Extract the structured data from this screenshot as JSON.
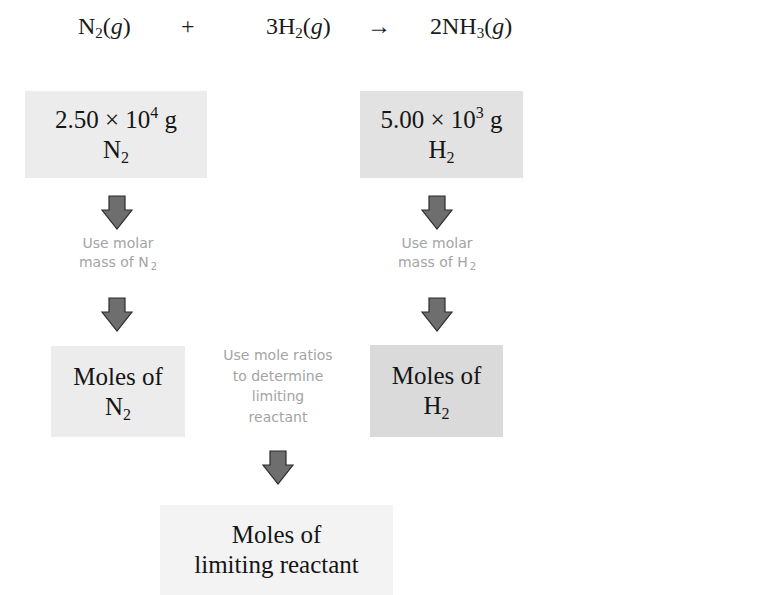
{
  "equation": {
    "reactant1": {
      "prefix": "N",
      "sub": "2",
      "state": "g"
    },
    "plus": "+",
    "reactant2": {
      "prefix": "3H",
      "sub": "2",
      "state": "g"
    },
    "arrow": "→",
    "product": {
      "prefix": "2NH",
      "sub": "3",
      "state": "g"
    }
  },
  "boxes": {
    "mass_n2": {
      "mantissa": "2.50 × 10",
      "exp": "4",
      "unit": " g",
      "species": "N",
      "species_sub": "2"
    },
    "mass_h2": {
      "mantissa": "5.00 × 10",
      "exp": "3",
      "unit": " g",
      "species": "H",
      "species_sub": "2"
    },
    "moles_n2": {
      "line1": "Moles of",
      "species": "N",
      "species_sub": "2"
    },
    "moles_h2": {
      "line1": "Moles of",
      "species": "H",
      "species_sub": "2"
    },
    "moles_limiting": {
      "line1": "Moles of",
      "line2": "limiting reactant"
    }
  },
  "labels": {
    "molar_mass_n2": {
      "line1": "Use molar",
      "line2": "mass of N",
      "sub": "2"
    },
    "molar_mass_h2": {
      "line1": "Use molar",
      "line2": "mass of H",
      "sub": "2"
    },
    "mole_ratios": {
      "line1": "Use mole ratios",
      "line2": "to determine",
      "line3": "limiting",
      "line4": "reactant"
    }
  },
  "icons": {
    "arrow": "down-arrow-icon"
  },
  "colors": {
    "arrow_fill": "#6e6e6e",
    "arrow_stroke": "#2a2a2a",
    "label_text": "#a4a4a4",
    "box_light": "#ececec",
    "box_dark": "#dadada"
  }
}
